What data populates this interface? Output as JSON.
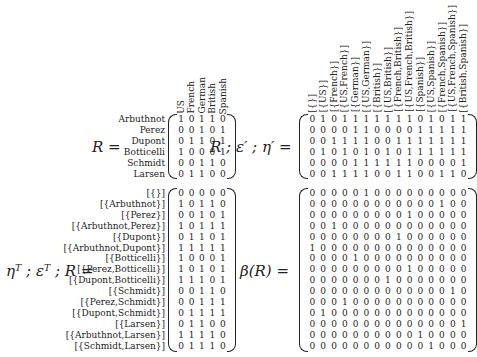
{
  "top_left": {
    "label": "R =",
    "row_labels": [
      "Arbuthnot",
      "Perez",
      "Dupont",
      "Botticelli",
      "Schmidt",
      "Larsen"
    ],
    "col_labels": [
      "US",
      "French",
      "German",
      "British",
      "Spanish"
    ],
    "rows": [
      [
        1,
        0,
        1,
        1,
        0
      ],
      [
        0,
        0,
        1,
        0,
        1
      ],
      [
        0,
        1,
        1,
        0,
        1
      ],
      [
        1,
        0,
        0,
        0,
        1
      ],
      [
        0,
        0,
        1,
        1,
        0
      ],
      [
        0,
        1,
        1,
        0,
        0
      ]
    ]
  },
  "top_right": {
    "label": "R ; ε′ ; η′ =",
    "col_labels": [
      "[{}]",
      "[{US}]",
      "[{French}]",
      "[{US,French}]",
      "[{German}]",
      "[{US,German}]",
      "[{British}]",
      "[{US,British}]",
      "[{French,British}]",
      "[{US,French,British}]",
      "[{Spanish}]",
      "[{US,Spanish}]",
      "[{French,Spanish}]",
      "[{US,French,Spanish}]",
      "[{British,Spanish}]"
    ],
    "rows": [
      [
        0,
        1,
        0,
        1,
        1,
        1,
        1,
        1,
        1,
        1,
        0,
        1,
        0,
        1,
        1
      ],
      [
        0,
        0,
        0,
        0,
        1,
        1,
        0,
        0,
        0,
        0,
        1,
        1,
        1,
        1,
        1
      ],
      [
        0,
        0,
        1,
        1,
        1,
        1,
        0,
        0,
        1,
        1,
        1,
        1,
        1,
        1,
        1
      ],
      [
        0,
        1,
        0,
        1,
        0,
        1,
        0,
        1,
        0,
        1,
        1,
        1,
        1,
        1,
        1
      ],
      [
        0,
        0,
        0,
        0,
        1,
        1,
        1,
        1,
        1,
        1,
        0,
        0,
        0,
        0,
        1
      ],
      [
        0,
        0,
        1,
        1,
        1,
        1,
        0,
        0,
        1,
        1,
        0,
        0,
        1,
        1,
        0
      ]
    ]
  },
  "bottom_left": {
    "label": "ηᵀ ; εᵀ ; R =",
    "row_labels": [
      "[{}]",
      "[{Arbuthnot}]",
      "[{Perez}]",
      "[{Arbuthnot,Perez}]",
      "[{Dupont}]",
      "[{Arbuthnot,Dupont}]",
      "[{Botticelli}]",
      "[{Perez,Botticelli}]",
      "[{Dupont,Botticelli}]",
      "[{Schmidt}]",
      "[{Perez,Schmidt}]",
      "[{Dupont,Schmidt}]",
      "[{Larsen}]",
      "[{Arbuthnot,Larsen}]",
      "[{Schmidt,Larsen}]"
    ],
    "rows": [
      [
        0,
        0,
        0,
        0,
        0
      ],
      [
        1,
        0,
        1,
        1,
        0
      ],
      [
        0,
        0,
        1,
        0,
        1
      ],
      [
        1,
        0,
        1,
        1,
        1
      ],
      [
        0,
        1,
        1,
        0,
        1
      ],
      [
        1,
        1,
        1,
        1,
        1
      ],
      [
        1,
        0,
        0,
        0,
        1
      ],
      [
        1,
        0,
        1,
        0,
        1
      ],
      [
        1,
        1,
        1,
        0,
        1
      ],
      [
        0,
        0,
        1,
        1,
        0
      ],
      [
        0,
        0,
        1,
        1,
        1
      ],
      [
        0,
        1,
        1,
        1,
        1
      ],
      [
        0,
        1,
        1,
        0,
        0
      ],
      [
        1,
        1,
        1,
        1,
        0
      ],
      [
        0,
        1,
        1,
        1,
        0
      ]
    ]
  },
  "bottom_right": {
    "label": "β(R) =",
    "rows": [
      [
        0,
        0,
        0,
        0,
        0,
        1,
        0,
        0,
        0,
        0,
        0,
        0,
        0,
        0,
        0
      ],
      [
        0,
        0,
        0,
        0,
        0,
        0,
        0,
        0,
        0,
        0,
        0,
        0,
        1,
        0,
        0
      ],
      [
        0,
        0,
        0,
        0,
        0,
        0,
        0,
        0,
        0,
        1,
        0,
        0,
        0,
        0,
        0
      ],
      [
        0,
        0,
        1,
        0,
        0,
        0,
        0,
        0,
        0,
        0,
        0,
        0,
        0,
        0,
        0
      ],
      [
        0,
        0,
        0,
        0,
        0,
        0,
        0,
        0,
        1,
        0,
        0,
        0,
        0,
        0,
        0
      ],
      [
        1,
        0,
        0,
        0,
        0,
        0,
        0,
        0,
        0,
        0,
        0,
        0,
        0,
        0,
        0
      ],
      [
        0,
        0,
        0,
        0,
        1,
        0,
        0,
        0,
        0,
        0,
        0,
        0,
        0,
        0,
        0
      ],
      [
        0,
        0,
        0,
        0,
        0,
        0,
        0,
        0,
        0,
        1,
        0,
        0,
        0,
        0,
        0
      ],
      [
        0,
        0,
        0,
        0,
        0,
        0,
        0,
        1,
        0,
        0,
        0,
        0,
        0,
        0,
        0
      ],
      [
        0,
        0,
        0,
        0,
        0,
        0,
        0,
        0,
        0,
        0,
        0,
        0,
        0,
        1,
        0
      ],
      [
        0,
        0,
        0,
        1,
        0,
        0,
        0,
        0,
        0,
        0,
        0,
        0,
        0,
        0,
        0
      ],
      [
        0,
        1,
        0,
        0,
        0,
        0,
        0,
        0,
        0,
        0,
        0,
        0,
        0,
        0,
        0
      ],
      [
        0,
        0,
        0,
        0,
        0,
        0,
        0,
        0,
        0,
        0,
        0,
        0,
        0,
        0,
        1
      ],
      [
        0,
        0,
        0,
        0,
        0,
        0,
        0,
        0,
        0,
        0,
        1,
        0,
        0,
        0,
        0
      ],
      [
        0,
        0,
        0,
        0,
        0,
        0,
        0,
        0,
        0,
        0,
        0,
        1,
        0,
        0,
        0
      ]
    ]
  }
}
